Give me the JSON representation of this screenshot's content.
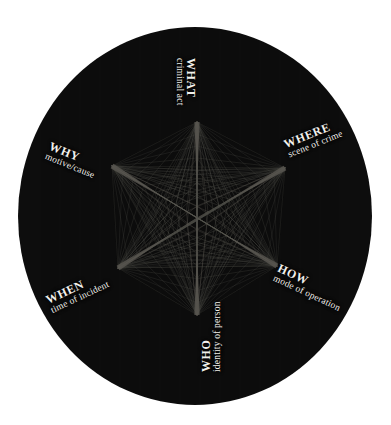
{
  "figure": {
    "background_color": "#ffffff",
    "disc_color": "#0d0d0d",
    "line_color": "#57554f",
    "text_color": "#f2f0ec"
  },
  "nodes": [
    {
      "id": "what",
      "keyword": "WHAT",
      "subtitle": "criminal act",
      "position": "top",
      "rotation_deg": 90,
      "vertex": {
        "x": 197,
        "y": 122
      }
    },
    {
      "id": "where",
      "keyword": "WHERE",
      "subtitle": "scene of crime",
      "position": "upper-right",
      "rotation_deg": -22,
      "vertex": {
        "x": 285,
        "y": 168
      }
    },
    {
      "id": "how",
      "keyword": "HOW",
      "subtitle": "mode of operation",
      "position": "lower-right",
      "rotation_deg": 25,
      "vertex": {
        "x": 277,
        "y": 266
      }
    },
    {
      "id": "who",
      "keyword": "WHO",
      "subtitle": "identity of person",
      "position": "bottom",
      "rotation_deg": -90,
      "vertex": {
        "x": 197,
        "y": 315
      }
    },
    {
      "id": "when",
      "keyword": "WHEN",
      "subtitle": "time of incident",
      "position": "lower-left",
      "rotation_deg": -25,
      "vertex": {
        "x": 118,
        "y": 268
      }
    },
    {
      "id": "why",
      "keyword": "WHY",
      "subtitle": "motive/cause",
      "position": "upper-left",
      "rotation_deg": 22,
      "vertex": {
        "x": 112,
        "y": 166
      }
    }
  ],
  "chart_data": {
    "type": "scatter",
    "center": {
      "x": 197,
      "y": 218
    },
    "disc": {
      "cx": 195,
      "cy": 216,
      "rx": 177,
      "ry": 189
    },
    "categories": [
      "WHAT",
      "WHERE",
      "HOW",
      "WHO",
      "WHEN",
      "WHY"
    ],
    "labels": [
      "criminal act",
      "scene of crime",
      "mode of operation",
      "identity of person",
      "time of incident",
      "motive/cause"
    ],
    "vertices": [
      [
        197,
        122
      ],
      [
        285,
        168
      ],
      [
        277,
        266
      ],
      [
        197,
        315
      ],
      [
        118,
        268
      ],
      [
        112,
        166
      ]
    ],
    "grid": false,
    "legend": "none"
  }
}
